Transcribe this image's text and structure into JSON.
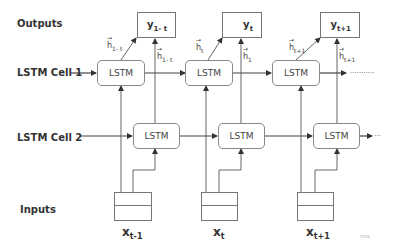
{
  "rows": {
    "outputs": "Outputs",
    "cell1": "LSTM Cell 1",
    "cell2": "LSTM Cell 2",
    "inputs": "Inputs"
  },
  "cell1_units": [
    {
      "label": "LSTM"
    },
    {
      "label": "LSTM"
    },
    {
      "label": "LSTM"
    }
  ],
  "cell2_units": [
    {
      "label": "LSTM"
    },
    {
      "label": "LSTM"
    },
    {
      "label": "LSTM"
    }
  ],
  "outputs": [
    {
      "base": "y",
      "sub": "1- t"
    },
    {
      "base": "y",
      "sub": "t"
    },
    {
      "base": "y",
      "sub": "t+1"
    }
  ],
  "hidden_left": [
    {
      "base": "h",
      "sub": "1- t"
    },
    {
      "base": "h",
      "sub": "t"
    },
    {
      "base": "h",
      "sub": "t+1"
    }
  ],
  "hidden_right": [
    {
      "base": "h",
      "sub": "1- t"
    },
    {
      "base": "h",
      "sub": "1"
    },
    {
      "base": "h",
      "sub": "t+1"
    }
  ],
  "inputs": [
    {
      "base": "x",
      "sub": "t-1"
    },
    {
      "base": "x",
      "sub": "t"
    },
    {
      "base": "x",
      "sub": "t+1"
    }
  ],
  "continuation": {
    "cell1": "...........",
    "cell2": "..."
  },
  "watermark": "mxa",
  "colors": {
    "line": "#444444",
    "box_border": "#888888",
    "text": "#333333"
  }
}
